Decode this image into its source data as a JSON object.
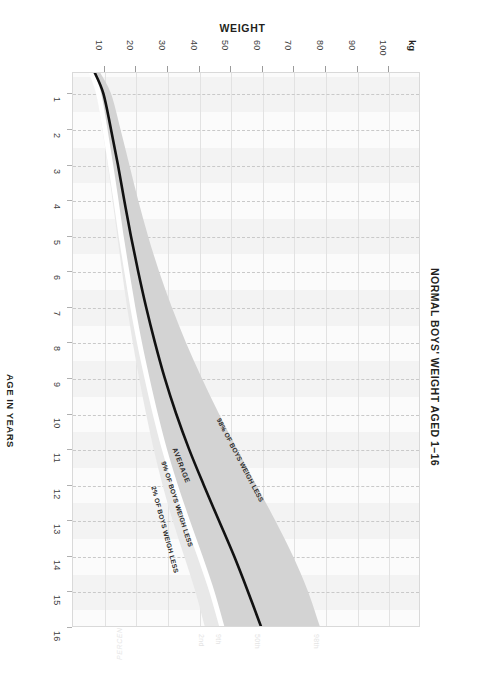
{
  "chart_title": "NORMAL BOYS' WEIGHT AGED 1–16",
  "axes": {
    "weight": {
      "title": "WEIGHT",
      "unit": "kg",
      "ticks": [
        10,
        20,
        30,
        40,
        50,
        60,
        70,
        80,
        90,
        100
      ],
      "range": [
        0,
        110
      ]
    },
    "age": {
      "title": "AGE IN YEARS",
      "ticks": [
        1,
        2,
        3,
        4,
        5,
        6,
        7,
        8,
        9,
        10,
        11,
        12,
        13,
        14,
        15,
        16
      ],
      "range": [
        0.4,
        16
      ]
    },
    "percentile": {
      "title": "PERCENTILE",
      "ticks": [
        "2nd",
        "9th",
        "50th",
        "98th"
      ]
    }
  },
  "annotations": {
    "p2": "2% OF BOYS WEIGH LESS",
    "p9": "9% OF BOYS WEIGH LESS",
    "average": "AVERAGE",
    "p98": "98% OF BOYS WEIGH LESS"
  },
  "colors": {
    "band_outer": "#e8e8e8",
    "band_inner": "#d3d3d3",
    "average_line": "#111111",
    "grid": "#e2e2e2",
    "grid_dashed": "#c9c9c9",
    "plot_bg": "#fbfbfb",
    "text": "#231f20"
  },
  "chart_data": {
    "type": "line",
    "title": "NORMAL BOYS' WEIGHT AGED 1–16",
    "xlabel": "WEIGHT",
    "ylabel": "AGE IN YEARS",
    "xlim": [
      0,
      110
    ],
    "ylim": [
      0.4,
      16
    ],
    "grid": true,
    "orientation": "age on vertical axis (top=1yr), weight on horizontal axis",
    "legend": [
      "2% OF BOYS WEIGH LESS",
      "9% OF BOYS WEIGH LESS",
      "AVERAGE",
      "98% OF BOYS WEIGH LESS"
    ],
    "x": [
      0.4,
      1,
      2,
      3,
      4,
      5,
      6,
      7,
      8,
      9,
      10,
      11,
      12,
      13,
      14,
      15,
      16
    ],
    "series": [
      {
        "name": "2nd percentile",
        "percentile": 2,
        "values": [
          5.5,
          7.7,
          9.6,
          11.3,
          12.8,
          14.3,
          15.8,
          17.4,
          19.2,
          21.2,
          23.4,
          25.8,
          28.6,
          31.8,
          35.4,
          39.0,
          42.0
        ]
      },
      {
        "name": "9th percentile",
        "percentile": 9,
        "values": [
          6.1,
          8.4,
          10.4,
          12.2,
          13.9,
          15.5,
          17.3,
          19.2,
          21.3,
          23.7,
          26.3,
          29.2,
          32.6,
          36.4,
          40.4,
          44.2,
          47.4
        ]
      },
      {
        "name": "AVERAGE (50th percentile)",
        "percentile": 50,
        "values": [
          7.1,
          9.9,
          12.3,
          14.5,
          16.5,
          18.6,
          20.9,
          23.4,
          26.2,
          29.3,
          32.9,
          37.0,
          41.6,
          46.4,
          51.2,
          55.6,
          59.8
        ]
      },
      {
        "name": "98th percentile",
        "percentile": 98,
        "values": [
          8.8,
          12.3,
          15.3,
          18.1,
          20.9,
          24.0,
          27.5,
          31.5,
          36.0,
          41.0,
          46.4,
          52.2,
          58.2,
          64.2,
          69.8,
          74.6,
          78.4
        ]
      }
    ],
    "bands": [
      {
        "name": "2nd–9th percentile band",
        "lower_series": "2nd percentile",
        "upper_series": "9th percentile",
        "fill": "#e8e8e8"
      },
      {
        "name": "9th–98th percentile band",
        "lower_series": "9th percentile",
        "upper_series": "98th percentile",
        "fill": "#d3d3d3"
      }
    ]
  }
}
